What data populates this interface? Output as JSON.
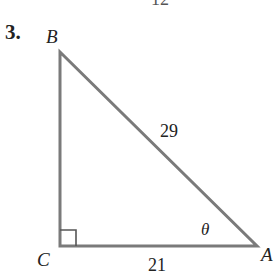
{
  "problem": {
    "number": "3.",
    "cut_off_label_above": "12"
  },
  "triangle": {
    "vertices": {
      "B": "B",
      "C": "C",
      "A": "A"
    },
    "sides": {
      "hypotenuse_AB": "29",
      "adjacent_CA": "21"
    },
    "angle_label": "θ",
    "right_angle_at": "C",
    "stroke_color": "#7a7a7a"
  }
}
